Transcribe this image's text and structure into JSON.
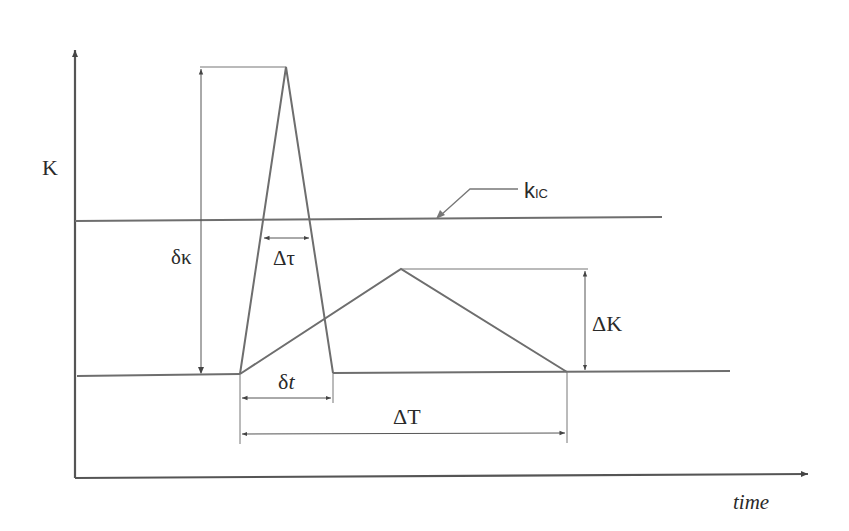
{
  "diagram": {
    "type": "stress-intensity vs time schematic",
    "axes": {
      "y_label": "K",
      "x_label": "time"
    },
    "lines": {
      "critical_label": "k",
      "critical_subscript": "IC"
    },
    "annotations": {
      "delta_kappa": "δκ",
      "delta_tau": "Δτ",
      "delta_K": "ΔK",
      "delta_t_prefix": "δ",
      "delta_t_var": "t",
      "delta_T": "ΔT"
    },
    "colors": {
      "line": "#6e6e6e",
      "axis": "#555555",
      "text": "#2a2a2a",
      "background": "#ffffff"
    }
  }
}
